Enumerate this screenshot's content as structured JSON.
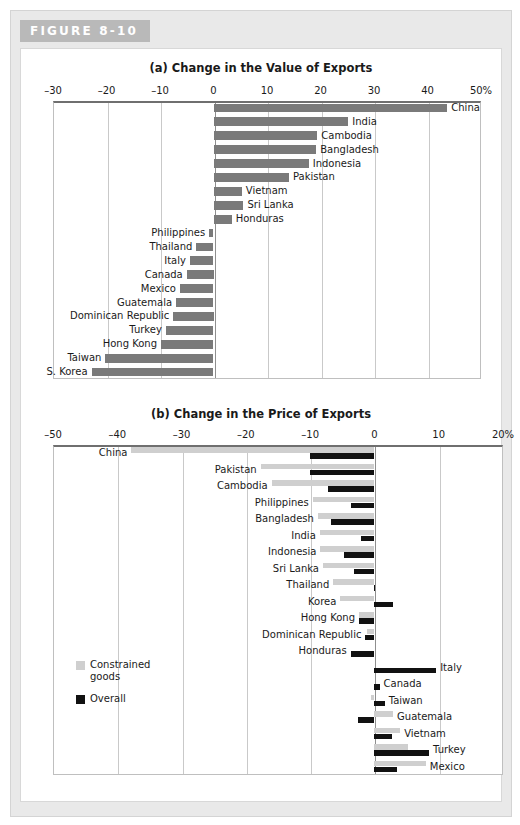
{
  "figure": {
    "tag": "FIGURE 8-10"
  },
  "legend": {
    "items": [
      {
        "label": "Constrained goods",
        "color": "#cfcfcf",
        "name": "constrained-goods"
      },
      {
        "label": "Overall",
        "color": "#111111",
        "name": "overall"
      }
    ]
  },
  "chart_data": [
    {
      "type": "bar",
      "orientation": "horizontal",
      "panel": "(a)",
      "title": "(a) Change in the Value of Exports",
      "xlabel": "",
      "ylabel": "",
      "xlim": [
        -30,
        50
      ],
      "xticks": [
        -30,
        -20,
        -10,
        0,
        10,
        20,
        30,
        40,
        50
      ],
      "xticklabels": [
        "–30",
        "–20",
        "–10",
        "0",
        "10",
        "20",
        "30",
        "40",
        "50%"
      ],
      "grid": true,
      "legend_position": "none",
      "series_color": "#7a7a7a",
      "categories": [
        "China",
        "India",
        "Cambodia",
        "Bangladesh",
        "Indonesia",
        "Pakistan",
        "Vietnam",
        "Sri Lanka",
        "Honduras",
        "Philippines",
        "Thailand",
        "Italy",
        "Canada",
        "Mexico",
        "Guatemala",
        "Dominican Republic",
        "Turkey",
        "Hong Kong",
        "Taiwan",
        "S. Korea"
      ],
      "values": [
        43.7,
        25.2,
        19.4,
        19.2,
        17.8,
        14.1,
        5.3,
        5.6,
        3.4,
        -0.8,
        -3.2,
        -4.4,
        -5.0,
        -6.3,
        -7.0,
        -7.5,
        -8.9,
        -9.8,
        -20.2,
        -22.8
      ]
    },
    {
      "type": "bar",
      "orientation": "horizontal",
      "panel": "(b)",
      "title": "(b) Change in the Price of Exports",
      "xlabel": "",
      "ylabel": "",
      "xlim": [
        -50,
        20
      ],
      "xticks": [
        -50,
        -40,
        -30,
        -20,
        -10,
        0,
        10,
        20
      ],
      "xticklabels": [
        "–50",
        "–40",
        "–30",
        "–20",
        "–10",
        "0",
        "10",
        "20%"
      ],
      "grid": true,
      "legend_position": "lower-left",
      "categories": [
        "China",
        "Pakistan",
        "Cambodia",
        "Philippines",
        "Bangladesh",
        "India",
        "Indonesia",
        "Sri Lanka",
        "Thailand",
        "Korea",
        "Hong Kong",
        "Dominican Republic",
        "Honduras",
        "Italy",
        "Canada",
        "Taiwan",
        "Guatemala",
        "Vietnam",
        "Turkey",
        "Mexico"
      ],
      "series": [
        {
          "name": "Constrained goods",
          "color": "#cfcfcf",
          "values": [
            -37.8,
            -17.7,
            -16.0,
            -9.6,
            -8.8,
            -8.5,
            -8.4,
            -8.0,
            -6.4,
            -5.3,
            -2.4,
            -1.1,
            0.0,
            0.0,
            0.0,
            -0.5,
            2.9,
            4.0,
            5.3,
            8.0
          ]
        },
        {
          "name": "Overall",
          "color": "#111111",
          "values": [
            -10.0,
            -10.0,
            -7.2,
            -3.7,
            -6.8,
            -2.1,
            -4.8,
            -3.2,
            -0.1,
            2.9,
            -2.4,
            -1.4,
            -3.7,
            9.6,
            0.8,
            1.6,
            -2.6,
            2.7,
            8.5,
            3.5
          ]
        }
      ]
    }
  ]
}
